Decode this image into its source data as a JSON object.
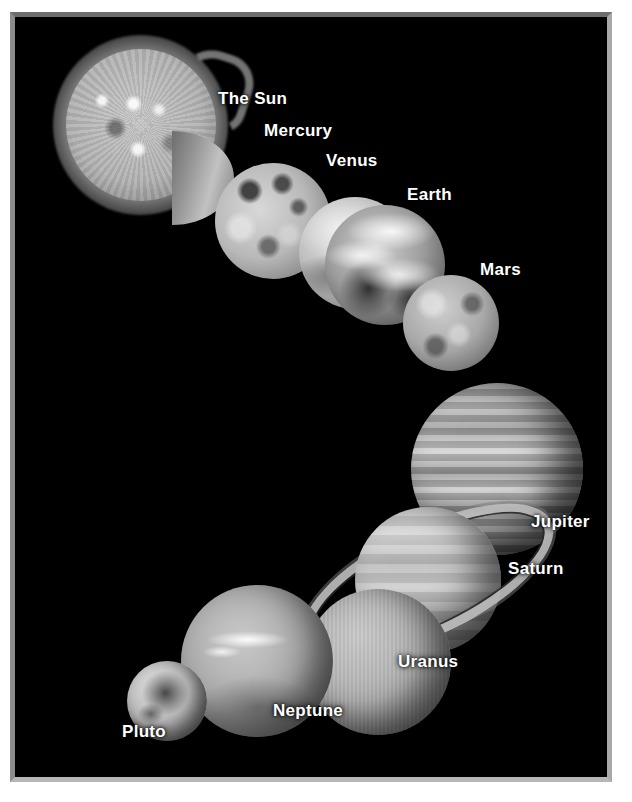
{
  "poster": {
    "title": "Solar System",
    "background_color": "#000000",
    "frame_color": "#9a9a9a",
    "page_color": "#ffffff",
    "label_color": "#ffffff"
  },
  "bodies": [
    {
      "name": "The Sun",
      "label": "The Sun",
      "label_x": 218,
      "label_y": 90
    },
    {
      "name": "Mercury",
      "label": "Mercury",
      "label_x": 264,
      "label_y": 122
    },
    {
      "name": "Venus",
      "label": "Venus",
      "label_x": 326,
      "label_y": 152
    },
    {
      "name": "Earth",
      "label": "Earth",
      "label_x": 407,
      "label_y": 186
    },
    {
      "name": "Mars",
      "label": "Mars",
      "label_x": 480,
      "label_y": 261
    },
    {
      "name": "Jupiter",
      "label": "Jupiter",
      "label_x": 531,
      "label_y": 513
    },
    {
      "name": "Saturn",
      "label": "Saturn",
      "label_x": 508,
      "label_y": 560
    },
    {
      "name": "Uranus",
      "label": "Uranus",
      "label_x": 398,
      "label_y": 653
    },
    {
      "name": "Neptune",
      "label": "Neptune",
      "label_x": 273,
      "label_y": 702
    },
    {
      "name": "Pluto",
      "label": "Pluto",
      "label_x": 122,
      "label_y": 723
    }
  ]
}
